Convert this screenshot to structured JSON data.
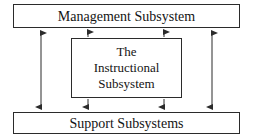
{
  "diagram": {
    "stroke_color": "#2b2b2b",
    "text_color": "#141414",
    "background_color": "#ffffff",
    "boxes": {
      "management": {
        "label": "Management Subsystem"
      },
      "instructional": {
        "line1": "The",
        "line2": "Instructional",
        "line3": "Subsystem"
      },
      "support": {
        "label": "Support Subsystems"
      }
    },
    "connectors": [
      {
        "name": "management-to-support-left",
        "from": "management",
        "to": "support",
        "arrowheads": "both",
        "x": 41
      },
      {
        "name": "management-to-instructional-left",
        "from": "management",
        "to": "instructional",
        "arrowheads": "both",
        "x": 88
      },
      {
        "name": "management-to-instructional-right",
        "from": "management",
        "to": "instructional",
        "arrowheads": "both",
        "x": 164
      },
      {
        "name": "management-to-support-right",
        "from": "management",
        "to": "support",
        "arrowheads": "both",
        "x": 212
      },
      {
        "name": "instructional-to-support-left",
        "from": "instructional",
        "to": "support",
        "arrowheads": "both",
        "x": 88
      },
      {
        "name": "instructional-to-support-right",
        "from": "instructional",
        "to": "support",
        "arrowheads": "both",
        "x": 164
      }
    ]
  }
}
